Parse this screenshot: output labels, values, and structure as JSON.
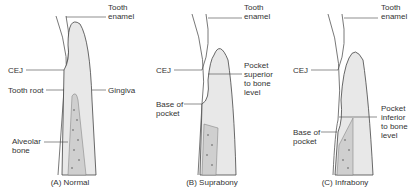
{
  "panels": [
    {
      "caption": "(A) Normal",
      "labels": {
        "enamel": "Tooth\nenamel",
        "cej": "CEJ",
        "root": "Tooth root",
        "gingiva": "Gingiva",
        "bone": "Alveolar\nbone"
      }
    },
    {
      "caption": "(B) Suprabony",
      "labels": {
        "enamel": "Tooth\nenamel",
        "cej": "CEJ",
        "pocket": "Pocket\nsuperior\nto bone\nlevel",
        "base": "Base of\npocket"
      }
    },
    {
      "caption": "(C) Infrabony",
      "labels": {
        "enamel": "Tooth\nenamel",
        "cej": "CEJ",
        "pocket": "Pocket\ninferior\nto bone\nlevel",
        "base": "Base of\npocket"
      }
    }
  ]
}
